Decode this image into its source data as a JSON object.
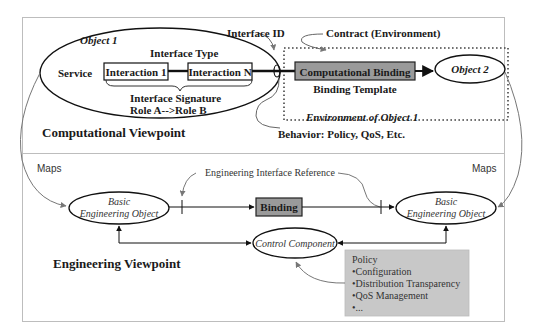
{
  "computational": {
    "viewpoint_label": "Computational Viewpoint",
    "object1": {
      "label": "Object 1",
      "service": "Service",
      "interface_type": "Interface Type",
      "interaction_first": "Interaction 1",
      "interaction_last": "Interaction N",
      "interface_signature": "Interface Signature",
      "role": "Role A-->Role B"
    },
    "interface_id": "Interface ID",
    "contract": "Contract (Environment)",
    "binding": "Computational Binding",
    "binding_template": "Binding Template",
    "environment": "Environment of Object 1",
    "behavior": "Behavior: Policy, QoS, Etc.",
    "object2": "Object 2"
  },
  "maps_left": "Maps",
  "maps_right": "Maps",
  "engineering": {
    "viewpoint_label": "Engineering Viewpoint",
    "interface_reference": "Engineering Interface Reference",
    "beo_left": {
      "line1": "Basic",
      "line2": "Engineering Object"
    },
    "beo_right": {
      "line1": "Basic",
      "line2": "Engineering Object"
    },
    "binding": "Binding",
    "control_component": "Control Component",
    "policy": {
      "title": "Policy",
      "items": [
        "•Configuration",
        "•Distribution Transparency",
        "•QoS Management",
        "•..."
      ]
    }
  },
  "colors": {
    "binding_fill": "#9a9a9a",
    "policy_fill": "#c8c8c8",
    "line": "#111111",
    "border": "#bdbdbd",
    "curve": "#666666"
  }
}
